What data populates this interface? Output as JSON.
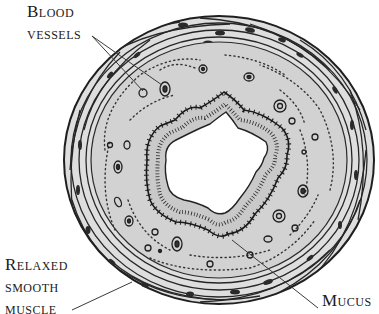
{
  "figure": {
    "labels": {
      "blood_vessels": {
        "line1": "Blood",
        "line2": "vessels"
      },
      "relaxed_smooth_muscle": {
        "line1": "Relaxed",
        "line2": "smooth",
        "line3": "muscle"
      },
      "mucus": {
        "line1": "Mucus"
      }
    },
    "colors": {
      "background": "#ffffff",
      "tissue_fill": "#d4d4d4",
      "muscle_fill": "#dcdcdc",
      "lumen": "#ffffff",
      "ink": "#1f1f1f"
    }
  }
}
